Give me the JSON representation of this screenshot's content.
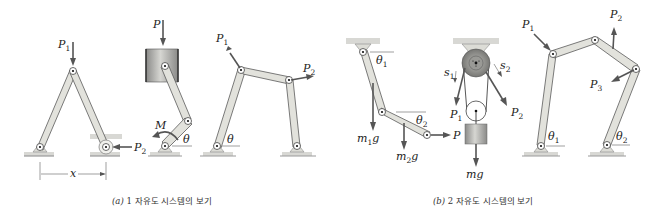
{
  "figure": {
    "panels": [
      {
        "id": "a",
        "caption_letter": "(a)",
        "caption_text": "1 자유도 시스템의 보기",
        "mechanisms": [
          {
            "name": "a-frame",
            "labels": {
              "p1": "P",
              "p1_sub": "1",
              "p2": "P",
              "p2_sub": "2",
              "x": "x"
            }
          },
          {
            "name": "piston-crank",
            "labels": {
              "p": "P",
              "m": "M",
              "theta": "θ"
            }
          },
          {
            "name": "four-bar",
            "labels": {
              "p1": "P",
              "p1_sub": "1",
              "p2": "P",
              "p2_sub": "2",
              "theta": "θ"
            }
          }
        ]
      },
      {
        "id": "b",
        "caption_letter": "(b)",
        "caption_text": "2 자유도 시스템의 보기",
        "mechanisms": [
          {
            "name": "double-pendulum",
            "labels": {
              "theta1": "θ",
              "theta1_sub": "1",
              "theta2": "θ",
              "theta2_sub": "2",
              "m1g": "m",
              "m1g_sub": "1",
              "m1g_g": "g",
              "m2g": "m",
              "m2g_sub": "2",
              "m2g_g": "g",
              "p": "P"
            }
          },
          {
            "name": "pulley-system",
            "labels": {
              "s1": "s",
              "s1_sub": "1",
              "s2": "s",
              "s2_sub": "2",
              "p1": "P",
              "p1_sub": "1",
              "p2": "P",
              "p2_sub": "2",
              "mg": "mg"
            }
          },
          {
            "name": "five-bar",
            "labels": {
              "p1": "P",
              "p1_sub": "1",
              "p2": "P",
              "p2_sub": "2",
              "p3": "P",
              "p3_sub": "3",
              "theta1": "θ",
              "theta1_sub": "1",
              "theta2": "θ",
              "theta2_sub": "2"
            }
          }
        ]
      }
    ]
  }
}
